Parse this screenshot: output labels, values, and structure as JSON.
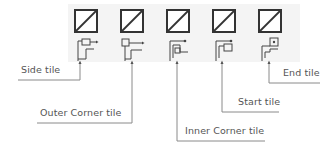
{
  "diagram": {
    "tiles": [
      {
        "id": "side",
        "label": "Side tile",
        "icon": "side-tile-icon"
      },
      {
        "id": "outer-corner",
        "label": "Outer Corner tile",
        "icon": "outer-corner-tile-icon"
      },
      {
        "id": "inner-corner",
        "label": "Inner Corner tile",
        "icon": "inner-corner-tile-icon"
      },
      {
        "id": "start",
        "label": "Start tile",
        "icon": "start-tile-icon"
      },
      {
        "id": "end",
        "label": "End tile",
        "icon": "end-tile-icon"
      }
    ],
    "colors": {
      "line": "#333333",
      "band": "#f4f4f4",
      "leader": "#777777",
      "text": "#555555"
    }
  }
}
